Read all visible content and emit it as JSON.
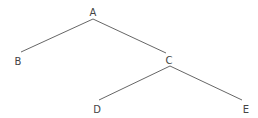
{
  "diagram": {
    "type": "tree",
    "colors": {
      "edge": "#555555",
      "label": "#444444",
      "background": "#ffffff"
    },
    "nodes": [
      {
        "id": "A",
        "label": "A",
        "x": 93,
        "y": 16
      },
      {
        "id": "B",
        "label": "B",
        "x": 18,
        "y": 65
      },
      {
        "id": "C",
        "label": "C",
        "x": 169,
        "y": 64
      },
      {
        "id": "D",
        "label": "D",
        "x": 97,
        "y": 113
      },
      {
        "id": "E",
        "label": "E",
        "x": 246,
        "y": 113
      }
    ],
    "edges": [
      {
        "from": "A",
        "to": "B",
        "x1": 93,
        "y1": 19,
        "x2": 21,
        "y2": 52
      },
      {
        "from": "A",
        "to": "C",
        "x1": 93,
        "y1": 19,
        "x2": 166,
        "y2": 53
      },
      {
        "from": "C",
        "to": "D",
        "x1": 170,
        "y1": 66,
        "x2": 99,
        "y2": 100
      },
      {
        "from": "C",
        "to": "E",
        "x1": 170,
        "y1": 66,
        "x2": 242,
        "y2": 100
      }
    ]
  }
}
